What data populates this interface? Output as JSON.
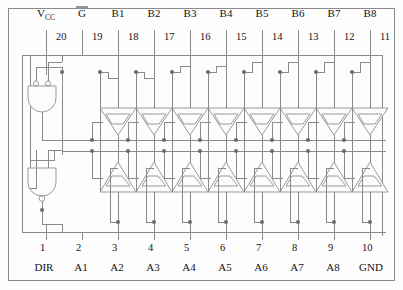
{
  "diagram": {
    "colors": {
      "wire": "#8a8a8a",
      "gate": "#9a9a9a",
      "text": "#141414",
      "background": "#fdfdfd",
      "junction": "#6d6d6d"
    }
  },
  "top": {
    "signals": [
      {
        "name": "Vcc",
        "base": "V",
        "sub": "CC",
        "pin": "20",
        "x": 46
      },
      {
        "name": "Gbar",
        "base": "G",
        "sub": "",
        "pin": "19",
        "x": 82,
        "overline": true
      },
      {
        "name": "B1",
        "base": "B1",
        "sub": "",
        "pin": "18",
        "x": 118
      },
      {
        "name": "B2",
        "base": "B2",
        "sub": "",
        "pin": "17",
        "x": 154
      },
      {
        "name": "B3",
        "base": "B3",
        "sub": "",
        "pin": "16",
        "x": 190
      },
      {
        "name": "B4",
        "base": "B4",
        "sub": "",
        "pin": "15",
        "x": 226
      },
      {
        "name": "B5",
        "base": "B5",
        "sub": "",
        "pin": "14",
        "x": 262
      },
      {
        "name": "B6",
        "base": "B6",
        "sub": "",
        "pin": "13",
        "x": 298
      },
      {
        "name": "B7",
        "base": "B7",
        "sub": "",
        "pin": "12",
        "x": 334
      },
      {
        "name": "B8",
        "base": "B8",
        "sub": "",
        "pin": "11",
        "x": 370
      }
    ]
  },
  "bottom": {
    "signals": [
      {
        "name": "DIR",
        "pin": "1",
        "x": 46
      },
      {
        "name": "A1",
        "pin": "2",
        "x": 82
      },
      {
        "name": "A2",
        "pin": "3",
        "x": 118
      },
      {
        "name": "A3",
        "pin": "4",
        "x": 154
      },
      {
        "name": "A4",
        "pin": "5",
        "x": 190
      },
      {
        "name": "A5",
        "pin": "6",
        "x": 226
      },
      {
        "name": "A6",
        "pin": "7",
        "x": 262
      },
      {
        "name": "A7",
        "pin": "8",
        "x": 298
      },
      {
        "name": "A8",
        "pin": "9",
        "x": 334
      },
      {
        "name": "GND",
        "pin": "10",
        "x": 370
      }
    ]
  },
  "gates": {
    "upper_and": {
      "name": "b-to-a-enable-and-gate",
      "x": 38,
      "y": 82
    },
    "lower_and": {
      "name": "a-to-b-enable-and-gate",
      "x": 38,
      "y": 168
    }
  },
  "buffers": {
    "upper_row_label": "b-output-tristate-buffer",
    "lower_row_label": "a-output-tristate-buffer",
    "count": 8,
    "upper_y": 104,
    "lower_y": 155,
    "xs": [
      118,
      154,
      190,
      226,
      262,
      298,
      334,
      370
    ]
  }
}
